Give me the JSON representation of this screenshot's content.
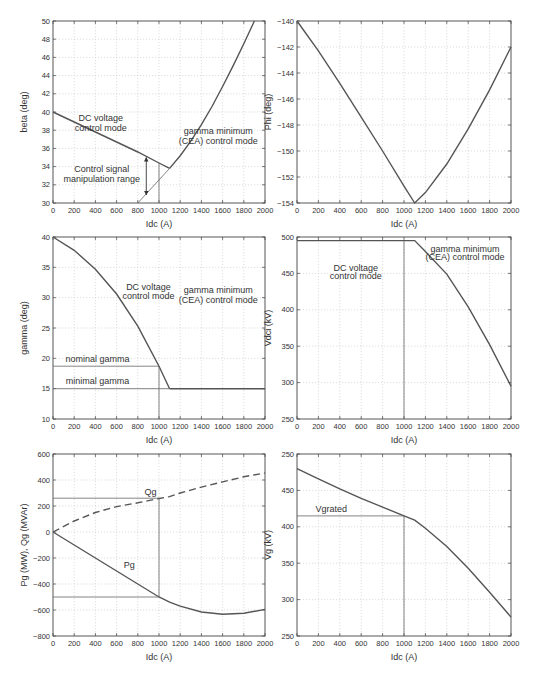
{
  "chart_data": [
    {
      "id": "beta",
      "type": "line",
      "box": {
        "x0": 53,
        "x1": 265,
        "y0": 21,
        "y1": 203
      },
      "xlabel": "Idc (A)",
      "ylabel": "beta (deg)",
      "xlim": [
        0,
        2000
      ],
      "ylim": [
        30,
        50
      ],
      "xticks": [
        0,
        200,
        400,
        600,
        800,
        1000,
        1200,
        1400,
        1600,
        1800,
        2000
      ],
      "yticks": [
        30,
        32,
        34,
        36,
        38,
        40,
        42,
        44,
        46,
        48,
        50
      ],
      "grid": true,
      "series": [
        {
          "name": "beta DC voltage control",
          "style": "curve",
          "x": [
            0,
            200,
            400,
            600,
            800,
            1000,
            1100
          ],
          "y": [
            40,
            38.9,
            37.8,
            36.7,
            35.6,
            34.4,
            33.8
          ]
        },
        {
          "name": "beta gamma minimum",
          "style": "curve",
          "x": [
            1100,
            1200,
            1300,
            1400,
            1500,
            1600,
            1700,
            1800,
            1900
          ],
          "y": [
            33.8,
            35.2,
            36.8,
            38.6,
            40.6,
            42.8,
            45.1,
            47.5,
            50
          ]
        },
        {
          "name": "beta CEA extension",
          "style": "thin",
          "x": [
            800,
            1100
          ],
          "y": [
            30,
            33.8
          ]
        },
        {
          "name": "Idc 1000 marker",
          "style": "thin",
          "x": [
            1000,
            1000
          ],
          "y": [
            30,
            34.4
          ]
        }
      ],
      "arrows": [
        {
          "x": 880,
          "y_from": 35.0,
          "y_to": 30.9
        }
      ],
      "annotations": [
        {
          "text": "DC voltage",
          "x": 450,
          "y": 39.0
        },
        {
          "text": "control mode",
          "x": 450,
          "y": 37.9
        },
        {
          "text": "gamma minimum",
          "x": 1560,
          "y": 37.6
        },
        {
          "text": "(CEA) control mode",
          "x": 1560,
          "y": 36.5
        },
        {
          "text": "Control signal",
          "x": 460,
          "y": 33.4
        },
        {
          "text": "manipulation range",
          "x": 460,
          "y": 32.3
        }
      ]
    },
    {
      "id": "phi",
      "type": "line",
      "box": {
        "x0": 297,
        "x1": 511,
        "y0": 21,
        "y1": 203
      },
      "xlabel": "Idc (A)",
      "ylabel": "Phi (deg)",
      "xlim": [
        0,
        2000
      ],
      "ylim": [
        -154,
        -140
      ],
      "xticks": [
        0,
        200,
        400,
        600,
        800,
        1000,
        1200,
        1400,
        1600,
        1800,
        2000
      ],
      "yticks": [
        -154,
        -152,
        -150,
        -148,
        -146,
        -144,
        -142,
        -140
      ],
      "grid": true,
      "series": [
        {
          "name": "Phi",
          "style": "curve",
          "x": [
            0,
            200,
            400,
            600,
            800,
            1000,
            1100,
            1200,
            1400,
            1600,
            1800,
            2000
          ],
          "y": [
            -140,
            -142.3,
            -144.8,
            -147.4,
            -150,
            -152.7,
            -154,
            -153.2,
            -151,
            -148.3,
            -145.3,
            -142
          ]
        }
      ],
      "annotations": []
    },
    {
      "id": "gamma",
      "type": "line",
      "box": {
        "x0": 53,
        "x1": 265,
        "y0": 237,
        "y1": 419
      },
      "xlabel": "Idc (A)",
      "ylabel": "gamma (deg)",
      "xlim": [
        0,
        2000
      ],
      "ylim": [
        10,
        40
      ],
      "xticks": [
        0,
        200,
        400,
        600,
        800,
        1000,
        1200,
        1400,
        1600,
        1800,
        2000
      ],
      "yticks": [
        10,
        15,
        20,
        25,
        30,
        35,
        40
      ],
      "grid": true,
      "series": [
        {
          "name": "gamma DC voltage control",
          "style": "curve",
          "x": [
            0,
            200,
            400,
            600,
            800,
            1000,
            1100
          ],
          "y": [
            40,
            37.8,
            34.7,
            30.6,
            25.3,
            18.7,
            15
          ]
        },
        {
          "name": "gamma minimal",
          "style": "curve",
          "x": [
            1100,
            2000
          ],
          "y": [
            15,
            15
          ]
        },
        {
          "name": "nominal gamma line",
          "style": "thin",
          "x": [
            0,
            1000
          ],
          "y": [
            18.7,
            18.7
          ]
        },
        {
          "name": "minimal gamma line",
          "style": "thin",
          "x": [
            0,
            1100
          ],
          "y": [
            15,
            15
          ]
        },
        {
          "name": "Idc 1000 marker",
          "style": "thin",
          "x": [
            1000,
            1000
          ],
          "y": [
            10,
            18.7
          ]
        }
      ],
      "annotations": [
        {
          "text": "DC voltage",
          "x": 900,
          "y": 31.2
        },
        {
          "text": "control mode",
          "x": 900,
          "y": 29.7
        },
        {
          "text": "gamma minimum",
          "x": 1560,
          "y": 30.7
        },
        {
          "text": "(CEA) control mode",
          "x": 1560,
          "y": 29.2
        },
        {
          "text": "nominal gamma",
          "x": 420,
          "y": 19.4
        },
        {
          "text": "minimal gamma",
          "x": 420,
          "y": 15.8
        }
      ]
    },
    {
      "id": "vdci",
      "type": "line",
      "box": {
        "x0": 297,
        "x1": 511,
        "y0": 237,
        "y1": 419
      },
      "xlabel": "Idc (A)",
      "ylabel": "Vdci (kV)",
      "xlim": [
        0,
        2000
      ],
      "ylim": [
        250,
        500
      ],
      "xticks": [
        0,
        200,
        400,
        600,
        800,
        1000,
        1200,
        1400,
        1600,
        1800,
        2000
      ],
      "yticks": [
        250,
        300,
        350,
        400,
        450,
        500
      ],
      "grid": true,
      "series": [
        {
          "name": "Vdci",
          "style": "curve",
          "x": [
            0,
            1100,
            1200,
            1400,
            1600,
            1800,
            2000
          ],
          "y": [
            495,
            495,
            480,
            449,
            404,
            352,
            295
          ]
        },
        {
          "name": "Idc 1000 marker",
          "style": "thin",
          "x": [
            1000,
            1000
          ],
          "y": [
            250,
            495
          ]
        }
      ],
      "annotations": [
        {
          "text": "DC voltage",
          "x": 550,
          "y": 453
        },
        {
          "text": "control mode",
          "x": 550,
          "y": 442
        },
        {
          "text": "gamma minimum",
          "x": 1570,
          "y": 480
        },
        {
          "text": "(CEA) control mode",
          "x": 1570,
          "y": 469
        }
      ]
    },
    {
      "id": "pq",
      "type": "line",
      "box": {
        "x0": 53,
        "x1": 265,
        "y0": 454,
        "y1": 636
      },
      "xlabel": "Idc (A)",
      "ylabel": "Pg (MW), Qg (MVAr)",
      "xlim": [
        0,
        2000
      ],
      "ylim": [
        -800,
        600
      ],
      "xticks": [
        0,
        200,
        400,
        600,
        800,
        1000,
        1200,
        1400,
        1600,
        1800,
        2000
      ],
      "yticks": [
        -800,
        -600,
        -400,
        -200,
        0,
        200,
        400,
        600
      ],
      "grid": true,
      "series": [
        {
          "name": "Qg",
          "style": "dashed",
          "x": [
            0,
            200,
            400,
            600,
            800,
            1000,
            1100,
            1200,
            1400,
            1600,
            1800,
            2000
          ],
          "y": [
            0,
            85,
            150,
            195,
            225,
            258,
            272,
            300,
            345,
            385,
            425,
            455
          ]
        },
        {
          "name": "Pg",
          "style": "curve",
          "x": [
            0,
            200,
            400,
            600,
            800,
            1000,
            1100,
            1200,
            1400,
            1600,
            1800,
            2000
          ],
          "y": [
            0,
            -100,
            -200,
            -300,
            -400,
            -500,
            -540,
            -570,
            -615,
            -632,
            -625,
            -595
          ]
        },
        {
          "name": "Qg ref line",
          "style": "thin",
          "x": [
            0,
            1000
          ],
          "y": [
            260,
            260
          ]
        },
        {
          "name": "Pg ref line",
          "style": "thin",
          "x": [
            0,
            1000
          ],
          "y": [
            -500,
            -500
          ]
        },
        {
          "name": "Idc 1000 marker",
          "style": "thin",
          "x": [
            1000,
            1000
          ],
          "y": [
            -500,
            260
          ]
        }
      ],
      "annotations": [
        {
          "text": "Qg",
          "x": 920,
          "y": 285
        },
        {
          "text": "Pg",
          "x": 720,
          "y": -275
        }
      ]
    },
    {
      "id": "vg",
      "type": "line",
      "box": {
        "x0": 297,
        "x1": 511,
        "y0": 454,
        "y1": 636
      },
      "xlabel": "Idc (A)",
      "ylabel": "Vg (kV)",
      "xlim": [
        0,
        2000
      ],
      "ylim": [
        250,
        500
      ],
      "xticks": [
        0,
        200,
        400,
        600,
        800,
        1000,
        1200,
        1400,
        1600,
        1800,
        2000
      ],
      "yticks": [
        250,
        300,
        350,
        400,
        450,
        500
      ],
      "ytick_labels": [
        "250",
        "300",
        "350",
        "400",
        "450",
        "250"
      ],
      "grid": true,
      "series": [
        {
          "name": "Vg",
          "style": "curve",
          "x": [
            0,
            200,
            400,
            600,
            800,
            1000,
            1100,
            1200,
            1400,
            1600,
            1800,
            2000
          ],
          "y": [
            480,
            466,
            452,
            439,
            427,
            415,
            409,
            398,
            373,
            343,
            310,
            276
          ]
        },
        {
          "name": "Vgrated line",
          "style": "thin",
          "x": [
            0,
            1000
          ],
          "y": [
            415,
            415
          ]
        },
        {
          "name": "Idc 1000 marker",
          "style": "thin",
          "x": [
            1000,
            1000
          ],
          "y": [
            250,
            415
          ]
        }
      ],
      "annotations": [
        {
          "text": "Vgrated",
          "x": 320,
          "y": 420
        }
      ]
    }
  ]
}
